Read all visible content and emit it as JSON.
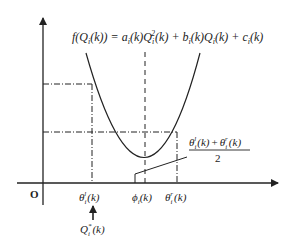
{
  "diagram": {
    "type": "quadratic cost curve",
    "equation": {
      "lhs": "f(Q",
      "lhs_sub": "i",
      "lhs_tail": "(k)) = a",
      "a_sub": "i",
      "a_tail": "(k)Q",
      "q_sub": "i",
      "q_sup": "2",
      "q_tail": "(k) + b",
      "b_sub": "i",
      "b_tail": "(k)Q",
      "q2_sub": "i",
      "q2_tail": "(k) + c",
      "c_sub": "i",
      "c_tail": "(k)"
    },
    "origin_label": "O",
    "x_labels": {
      "theta_l": {
        "base": "θ",
        "sub": "i",
        "sup": "l",
        "tail": "(k)"
      },
      "phi": {
        "base": "ϕ",
        "sub": "i",
        "tail": "(k)"
      },
      "theta_r": {
        "base": "θ",
        "sub": "i",
        "sup": "r",
        "tail": "(k)"
      }
    },
    "optimum_label": {
      "base": "Q",
      "sub": "i",
      "sup": "*",
      "tail": "(k)"
    },
    "midpoint_label": {
      "numerator_a": {
        "base": "θ",
        "sub": "i",
        "sup": "l",
        "tail": "(k)"
      },
      "plus": "+",
      "numerator_b": {
        "base": "θ",
        "sub": "i",
        "sup": "r",
        "tail": "(k)"
      },
      "denominator": "2"
    },
    "colors": {
      "stroke": "#222222",
      "background": "#ffffff"
    }
  }
}
